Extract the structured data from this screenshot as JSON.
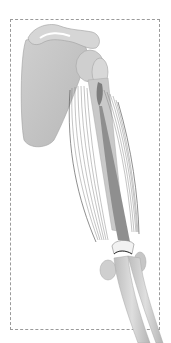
{
  "image": {
    "subject": "upper-arm-muscle-anatomy",
    "frame": {
      "style": "dashed",
      "color": "#9a9a9a"
    },
    "colors": {
      "bone_light": "#d9d9d9",
      "bone_mid": "#c4c4c4",
      "bone_dark": "#a8a8a8",
      "muscle_fiber": "#7a7a7a",
      "tendon": "#8c8c8c",
      "cartilage": "#f2f2f2",
      "background": "#ffffff"
    },
    "parts": [
      "scapula",
      "humerus",
      "muscle",
      "tendon",
      "elbow-joint",
      "radius",
      "ulna"
    ]
  }
}
